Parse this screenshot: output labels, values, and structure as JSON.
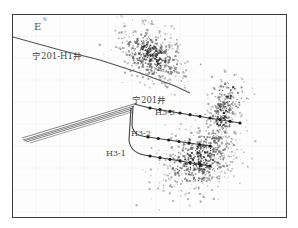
{
  "figure": {
    "compass": {
      "east_label": "E",
      "north_label": "N"
    },
    "wells": [
      {
        "name": "宁201-H1井",
        "label_x": 32,
        "label_y": 52
      },
      {
        "name": "宁201井",
        "label_x": 132,
        "label_y": 96
      },
      {
        "name": "H3-3",
        "label_x": 155,
        "label_y": 109
      },
      {
        "name": "H3-2",
        "label_x": 131,
        "label_y": 130
      },
      {
        "name": "H3-1",
        "label_x": 106,
        "label_y": 150
      }
    ],
    "colors": {
      "frame": "#3a3a3a",
      "well_line": "#555555",
      "event_dark": "#2a2a2a",
      "event_mid": "#6a6a6a",
      "event_light": "#9a9a9a",
      "grid": "#ececec"
    },
    "clusters": [
      {
        "name": "h1-events",
        "cx": 152,
        "cy": 55,
        "rx": 38,
        "ry": 24,
        "angle": 35,
        "count": 520
      },
      {
        "name": "h3-events-main",
        "cx": 200,
        "cy": 158,
        "rx": 42,
        "ry": 30,
        "angle": -35,
        "count": 620
      },
      {
        "name": "h3-events-north",
        "cx": 222,
        "cy": 115,
        "rx": 14,
        "ry": 32,
        "angle": 10,
        "count": 180
      },
      {
        "name": "h3-events-scatter",
        "cx": 230,
        "cy": 95,
        "rx": 18,
        "ry": 22,
        "angle": 0,
        "count": 70
      }
    ]
  }
}
